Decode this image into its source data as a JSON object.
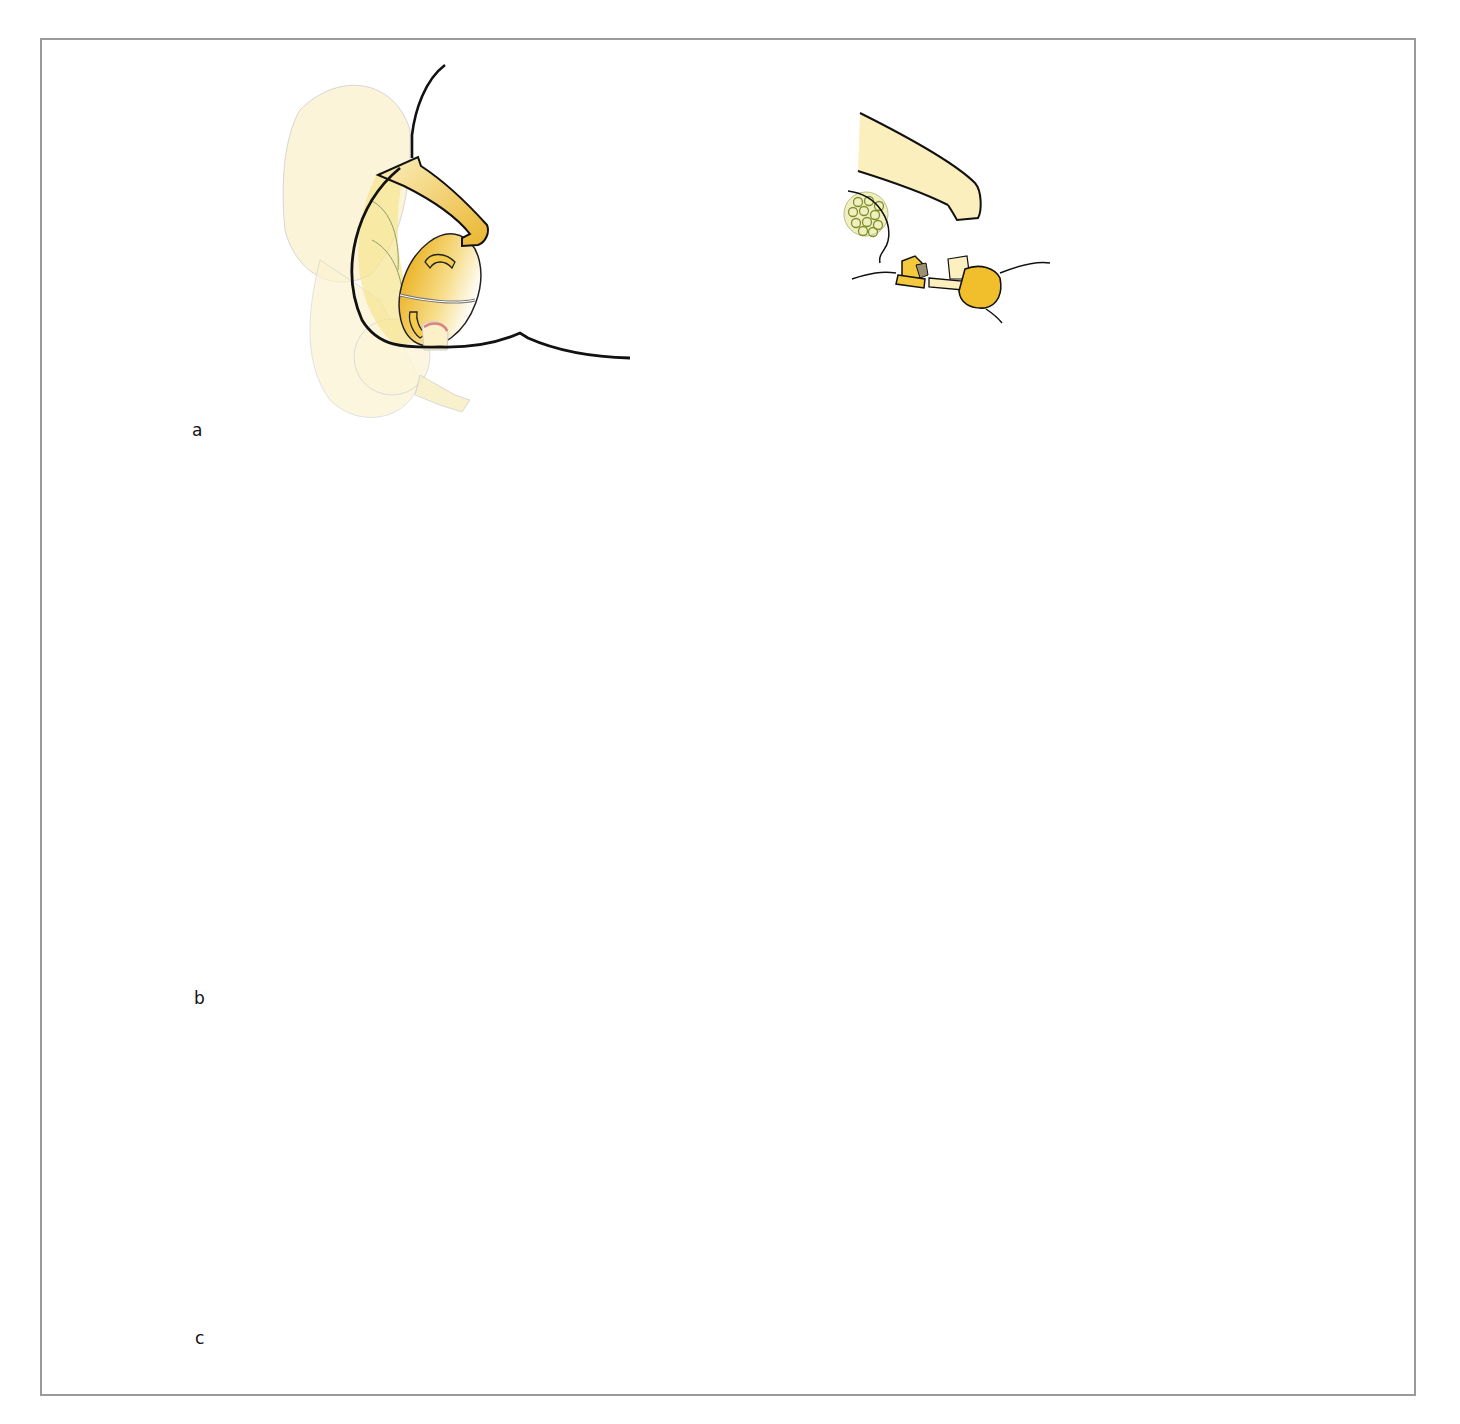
{
  "figure": {
    "panels": [
      {
        "id": "a",
        "label": "a"
      },
      {
        "id": "b",
        "label": "b"
      },
      {
        "id": "c",
        "label": "c"
      }
    ],
    "arrows": [
      {
        "from": "a",
        "to": "b",
        "direction": "down"
      },
      {
        "from": "b",
        "to": "c",
        "direction": "down"
      }
    ],
    "colors": {
      "frame": "#9a9a9a",
      "outline": "#111111",
      "tissue_light": "#fbf2c6",
      "tissue_mid": "#f3d77a",
      "tissue_dark": "#e9b52a",
      "pale_organ": "#fbf4d8",
      "nerve_bundle": "#f1f0c0",
      "nerve_fascicle": "#8a9a3a",
      "instrument": "#5b5e62",
      "electrode": "#b9bcc4",
      "cautery_red": "#e0211b"
    }
  }
}
